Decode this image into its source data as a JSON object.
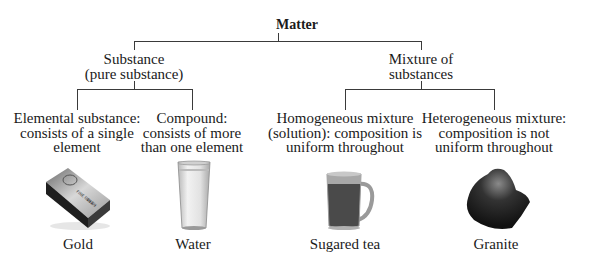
{
  "title": "Matter",
  "branches": [
    {
      "label_lines": [
        "Substance",
        "(pure substance)"
      ],
      "children": [
        {
          "label_lines": [
            "Elemental substance:",
            "consists of a single",
            "element"
          ],
          "example": "Gold",
          "image_icon": "gold-bar-icon"
        },
        {
          "label_lines": [
            "Compound:",
            "consists of more",
            "than one element"
          ],
          "example": "Water",
          "image_icon": "water-glass-icon"
        }
      ]
    },
    {
      "label_lines": [
        "Mixture of",
        "substances"
      ],
      "children": [
        {
          "label_lines": [
            "Homogeneous mixture",
            "(solution): composition is",
            "uniform throughout"
          ],
          "example": "Sugared tea",
          "image_icon": "tea-mug-icon"
        },
        {
          "label_lines": [
            "Heterogeneous mixture:",
            "composition is not",
            "uniform throughout"
          ],
          "example": "Granite",
          "image_icon": "granite-rock-icon"
        }
      ]
    }
  ]
}
